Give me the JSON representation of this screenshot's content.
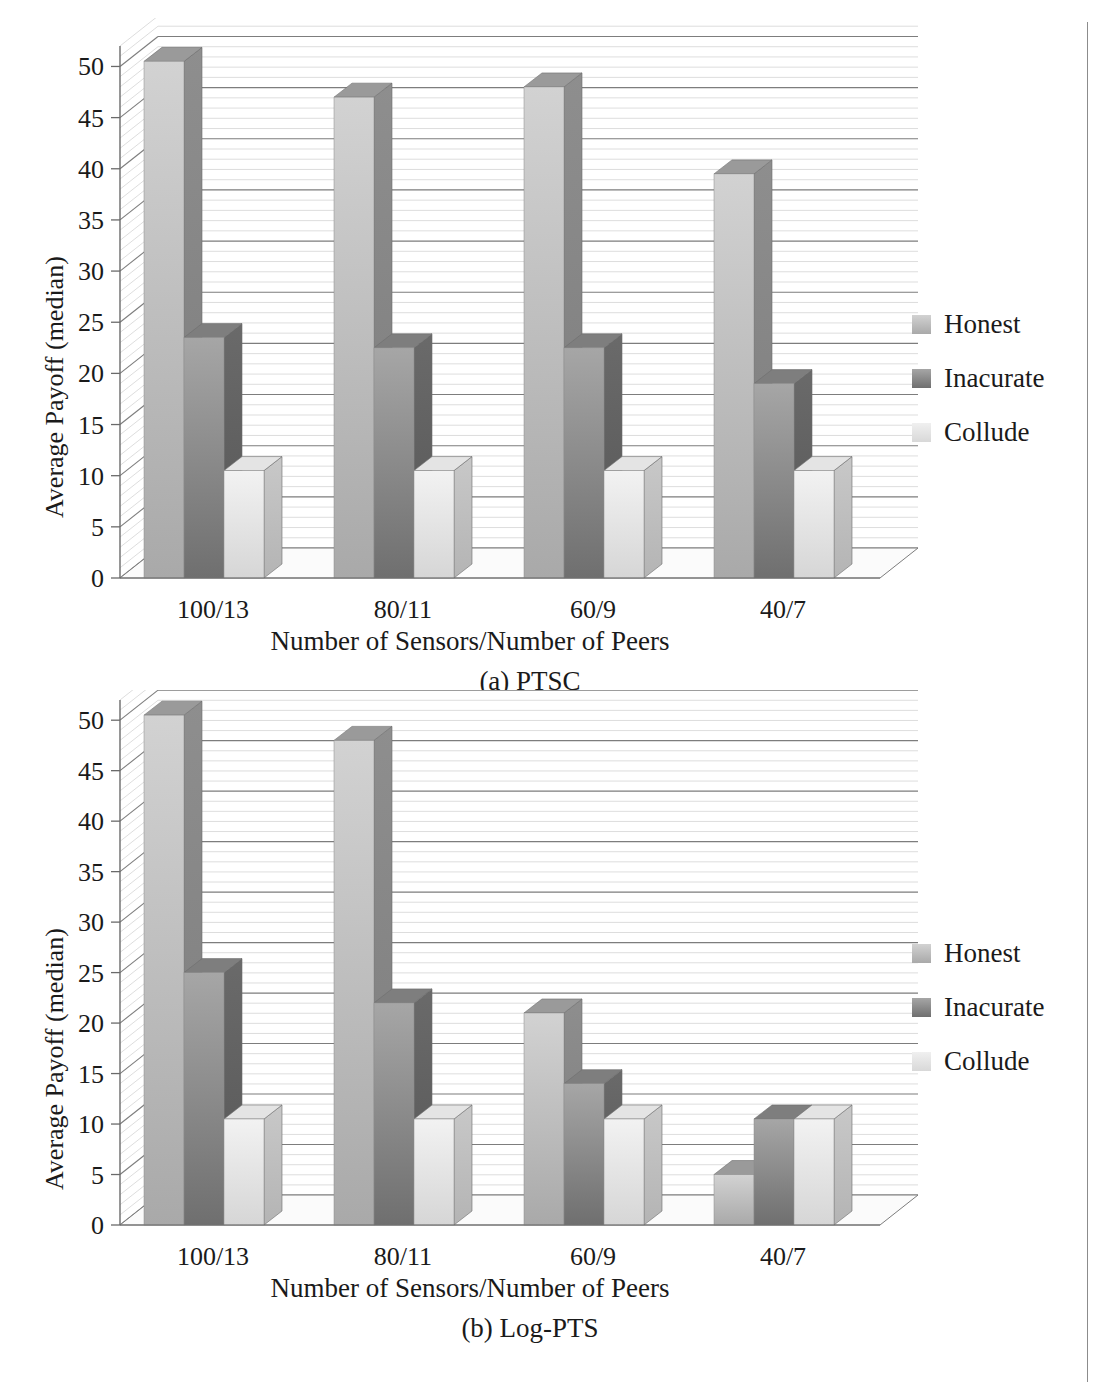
{
  "page": {
    "running_head": "",
    "background": "#ffffff",
    "rule_color": "#8c8c8c"
  },
  "colors": {
    "honest_front_top": "#d2d2d2",
    "honest_front_bottom": "#a9a9a9",
    "honest_side": "#7b7b7b",
    "honest_top": "#9a9a9a",
    "inacurate_front_top": "#a6a6a6",
    "inacurate_front_bottom": "#6f6f6f",
    "inacurate_side": "#565656",
    "inacurate_top": "#7e7e7e",
    "collude_front_top": "#f2f2f2",
    "collude_front_bottom": "#d6d6d6",
    "collude_side": "#b4b4b4",
    "collude_top": "#e4e4e4",
    "gridline_major": "#7d7d7d",
    "gridline_minor": "#cfcfcf",
    "axis": "#6a6a6a",
    "floor": "#fbfbfb",
    "text": "#1a1a1a"
  },
  "legend": {
    "items": [
      {
        "label": "Honest",
        "swatch_class": "sw-honest"
      },
      {
        "label": "Inacurate",
        "swatch_class": "sw-inac"
      },
      {
        "label": "Collude",
        "swatch_class": "sw-coll"
      }
    ]
  },
  "figure_a": {
    "caption": "(a) PTSC",
    "ylabel": "Average Payoff (median)",
    "xlabel": "Number of Sensors/Number of Peers"
  },
  "figure_b": {
    "caption": "(b) Log-PTS",
    "ylabel": "Average Payoff (median)",
    "xlabel": "Number of Sensors/Number of Peers"
  },
  "axis": {
    "ticks": [
      "50",
      "45",
      "40",
      "35",
      "30",
      "25",
      "20",
      "15",
      "10",
      "5",
      "0"
    ],
    "tick_values": [
      50,
      45,
      40,
      35,
      30,
      25,
      20,
      15,
      10,
      5,
      0
    ],
    "categories": [
      "100/13",
      "80/11",
      "60/9",
      "40/7"
    ]
  },
  "chart_data": [
    {
      "type": "bar",
      "title": "(a) PTSC",
      "xlabel": "Number of Sensors/Number of Peers",
      "ylabel": "Average Payoff (median)",
      "categories": [
        "100/13",
        "80/11",
        "60/9",
        "40/7"
      ],
      "series": [
        {
          "name": "Honest",
          "values": [
            50.5,
            47.0,
            48.0,
            39.5
          ]
        },
        {
          "name": "Inacurate",
          "values": [
            23.5,
            22.5,
            22.5,
            19.0
          ]
        },
        {
          "name": "Collude",
          "values": [
            10.5,
            10.5,
            10.5,
            10.5
          ]
        }
      ],
      "ylim": [
        0,
        52
      ],
      "ytick_step": 5,
      "minor_gridlines": true,
      "legend_position": "right",
      "three_d": true
    },
    {
      "type": "bar",
      "title": "(b) Log-PTS",
      "xlabel": "Number of Sensors/Number of Peers",
      "ylabel": "Average Payoff (median)",
      "categories": [
        "100/13",
        "80/11",
        "60/9",
        "40/7"
      ],
      "series": [
        {
          "name": "Honest",
          "values": [
            50.5,
            48.0,
            21.0,
            5.0
          ]
        },
        {
          "name": "Inacurate",
          "values": [
            25.0,
            22.0,
            14.0,
            10.5
          ]
        },
        {
          "name": "Collude",
          "values": [
            10.5,
            10.5,
            10.5,
            10.5
          ]
        }
      ],
      "ylim": [
        0,
        52
      ],
      "ytick_step": 5,
      "minor_gridlines": true,
      "legend_position": "right",
      "three_d": true
    }
  ]
}
